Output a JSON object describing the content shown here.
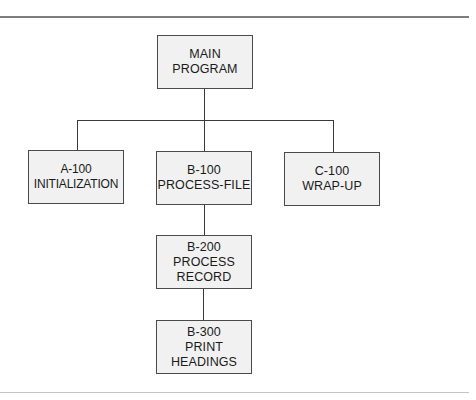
{
  "diagram": {
    "type": "hierarchy-chart",
    "nodes": [
      {
        "id": "main",
        "lines": [
          "MAIN",
          "PROGRAM"
        ],
        "parent": null
      },
      {
        "id": "a100",
        "lines": [
          "A-100",
          "INITIALIZATION"
        ],
        "parent": "main"
      },
      {
        "id": "b100",
        "lines": [
          "B-100",
          "PROCESS-FILE"
        ],
        "parent": "main"
      },
      {
        "id": "c100",
        "lines": [
          "C-100",
          "WRAP-UP"
        ],
        "parent": "main"
      },
      {
        "id": "b200",
        "lines": [
          "B-200",
          "PROCESS",
          "RECORD"
        ],
        "parent": "b100"
      },
      {
        "id": "b300",
        "lines": [
          "B-300",
          "PRINT",
          "HEADINGS"
        ],
        "parent": "b200"
      }
    ],
    "colors": {
      "box_fill": "#f1f1f1",
      "box_border": "#4a4a4a",
      "connector": "#3a3a3a",
      "top_rule": "#7d7d7d",
      "bottom_rule": "#c4c4c4"
    }
  }
}
